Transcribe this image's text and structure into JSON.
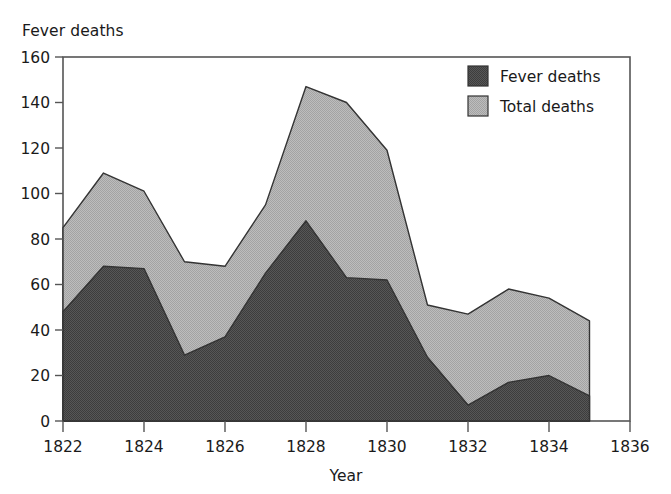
{
  "chart_data": {
    "type": "area",
    "title": "Fever deaths",
    "xlabel": "Year",
    "ylabel": "",
    "x": [
      1822,
      1823,
      1824,
      1825,
      1826,
      1827,
      1828,
      1829,
      1830,
      1831,
      1832,
      1833,
      1834,
      1835
    ],
    "series": [
      {
        "name": "Fever deaths",
        "color": "#4d4d4d",
        "values": [
          48,
          68,
          67,
          29,
          37,
          65,
          88,
          63,
          62,
          28,
          7,
          17,
          20,
          11
        ]
      },
      {
        "name": "Total deaths",
        "color": "#b3b3b3",
        "values": [
          85,
          109,
          101,
          70,
          68,
          95,
          147,
          140,
          119,
          51,
          47,
          58,
          54,
          44
        ]
      }
    ],
    "xlim": [
      1822,
      1836
    ],
    "ylim": [
      0,
      160
    ],
    "xticks": [
      "1822",
      "1824",
      "1826",
      "1828",
      "1830",
      "1832",
      "1834",
      "1836"
    ],
    "xtick_values": [
      1822,
      1824,
      1826,
      1828,
      1830,
      1832,
      1834,
      1836
    ],
    "yticks": [
      "0",
      "20",
      "40",
      "60",
      "80",
      "100",
      "120",
      "140",
      "160"
    ],
    "ytick_values": [
      0,
      20,
      40,
      60,
      80,
      100,
      120,
      140,
      160
    ],
    "grid": false,
    "legend_position": "top-right",
    "legend": [
      {
        "label": "Fever deaths",
        "swatch": "#4d4d4d"
      },
      {
        "label": "Total deaths",
        "swatch": "#b3b3b3"
      }
    ],
    "frame_color": "#555555",
    "outline_color": "#333333"
  }
}
